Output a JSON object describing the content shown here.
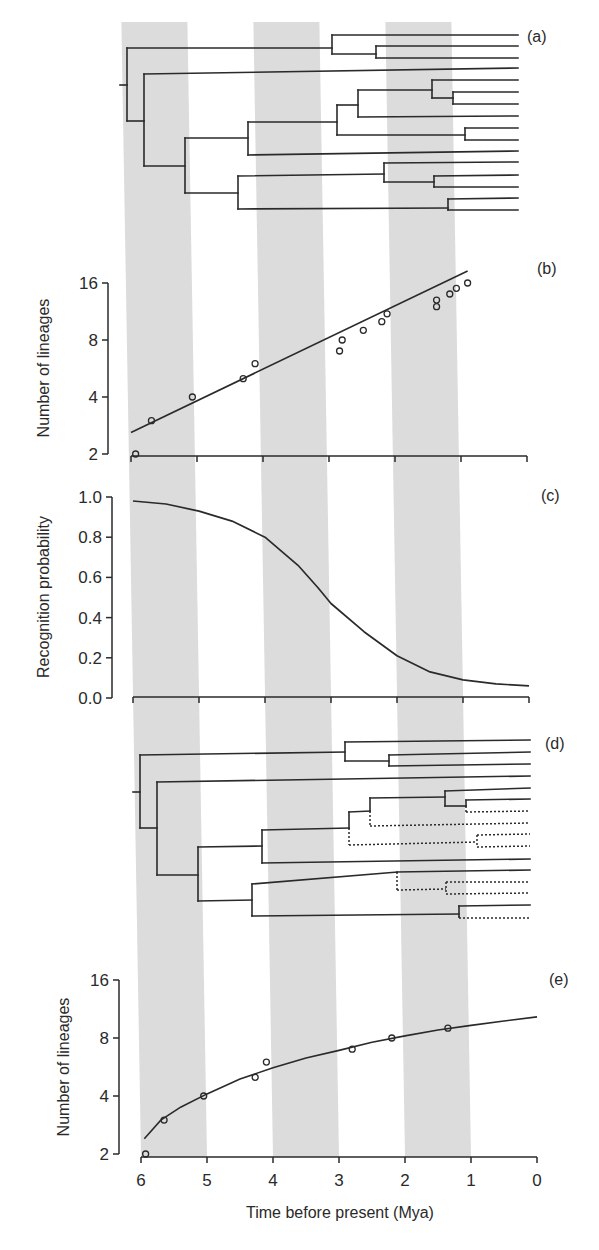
{
  "chart_data": [
    {
      "panel": "(a)",
      "type": "tree",
      "description": "Reconstructed phylogeny of 16 extant lineages",
      "tips": 16
    },
    {
      "panel": "(b)",
      "type": "scatter",
      "xlabel": "Time before present (Mya)",
      "ylabel": "Number of lineages",
      "yscale": "log2",
      "yticks": [
        2,
        4,
        8,
        16
      ],
      "ylim": [
        2,
        16
      ],
      "xlim": [
        6,
        0
      ],
      "x": [
        5.93,
        5.69,
        5.07,
        4.3,
        4.12,
        2.84,
        2.8,
        2.48,
        2.2,
        2.12,
        1.37,
        1.37,
        1.17,
        1.07,
        0.9
      ],
      "y": [
        2,
        3,
        4,
        5,
        6,
        7,
        8,
        9,
        10,
        11,
        12,
        13,
        14,
        15,
        16
      ],
      "fit_line": {
        "x": [
          6.0,
          0.9
        ],
        "y": [
          2.6,
          18.5
        ]
      }
    },
    {
      "panel": "(c)",
      "type": "line",
      "xlabel": "Time before present (Mya)",
      "ylabel": "Recognition probability",
      "yticks": [
        0.0,
        0.2,
        0.4,
        0.6,
        0.8,
        1.0
      ],
      "ylim": [
        0,
        1
      ],
      "xlim": [
        6,
        0
      ],
      "x": [
        6.0,
        5.5,
        5.0,
        4.5,
        4.0,
        3.5,
        3.2,
        3.0,
        2.5,
        2.0,
        1.5,
        1.0,
        0.5,
        0.0
      ],
      "y": [
        0.98,
        0.965,
        0.93,
        0.88,
        0.8,
        0.66,
        0.55,
        0.47,
        0.33,
        0.21,
        0.13,
        0.09,
        0.07,
        0.06
      ]
    },
    {
      "panel": "(d)",
      "type": "tree",
      "description": "Phylogeny with unrecognized lineages dashed",
      "tips": 16
    },
    {
      "panel": "(e)",
      "type": "scatter",
      "xlabel": "Time before present (Mya)",
      "ylabel": "Number of lineages",
      "yscale": "log2",
      "yticks": [
        2,
        4,
        8,
        16
      ],
      "ylim": [
        2,
        16
      ],
      "xlim": [
        6,
        0
      ],
      "xticks": [
        6,
        5,
        4,
        3,
        2,
        1,
        0
      ],
      "x": [
        5.93,
        5.65,
        5.05,
        4.27,
        4.1,
        2.8,
        2.2,
        1.35
      ],
      "y": [
        2,
        3,
        4,
        5,
        6,
        7,
        8,
        9
      ],
      "fit_curve": {
        "x": [
          5.95,
          5.7,
          5.4,
          5.0,
          4.5,
          4.0,
          3.5,
          3.0,
          2.5,
          2.0,
          1.5,
          1.0,
          0.5,
          0.0
        ],
        "y": [
          2.4,
          3.0,
          3.5,
          4.1,
          4.9,
          5.6,
          6.3,
          6.9,
          7.6,
          8.2,
          8.8,
          9.3,
          9.8,
          10.3
        ]
      }
    }
  ],
  "figure": {
    "panel_labels": [
      "(a)",
      "(b)",
      "(c)",
      "(d)",
      "(e)"
    ],
    "xlabel": "Time before present (Mya)",
    "xtick_labels": [
      "6",
      "5",
      "4",
      "3",
      "2",
      "1",
      "0"
    ],
    "ylabel_lineages": "Number of lineages",
    "ylabel_recognition": "Recognition probability",
    "ytick_lineages": [
      "16",
      "8",
      "4",
      "2"
    ],
    "ytick_recognition": [
      "1.0",
      "0.8",
      "0.6",
      "0.4",
      "0.2",
      "0.0"
    ],
    "shaded_bands_mya": [
      [
        6,
        5
      ],
      [
        4,
        3
      ],
      [
        2,
        1
      ]
    ],
    "colors": {
      "band": "#dcdcdc",
      "line": "#2a2a2a",
      "text": "#2a2a2a"
    }
  },
  "trees": {
    "a": {
      "solid": [
        [
          120,
          85,
          127,
          85
        ],
        [
          127,
          48,
          127,
          121
        ],
        [
          127,
          48,
          332,
          48
        ],
        [
          332,
          35,
          332,
          54
        ],
        [
          332,
          35,
          518,
          35
        ],
        [
          332,
          54,
          376,
          54
        ],
        [
          376,
          46,
          376,
          58
        ],
        [
          376,
          46,
          518,
          46
        ],
        [
          376,
          58,
          518,
          58
        ],
        [
          127,
          121,
          144,
          121
        ],
        [
          144,
          74,
          144,
          166
        ],
        [
          144,
          74,
          518,
          68
        ],
        [
          144,
          166,
          185,
          166
        ],
        [
          185,
          138,
          185,
          193
        ],
        [
          185,
          138,
          248,
          138
        ],
        [
          248,
          122,
          248,
          155
        ],
        [
          248,
          122,
          337,
          122
        ],
        [
          337,
          105,
          337,
          135
        ],
        [
          337,
          105,
          358,
          105
        ],
        [
          358,
          90,
          358,
          117
        ],
        [
          358,
          90,
          432,
          90
        ],
        [
          432,
          80,
          432,
          98
        ],
        [
          432,
          80,
          518,
          80
        ],
        [
          432,
          98,
          453,
          98
        ],
        [
          453,
          92,
          453,
          104
        ],
        [
          453,
          92,
          518,
          92
        ],
        [
          453,
          104,
          518,
          104
        ],
        [
          358,
          117,
          518,
          116
        ],
        [
          337,
          135,
          465,
          135
        ],
        [
          465,
          128,
          465,
          140
        ],
        [
          465,
          128,
          518,
          128
        ],
        [
          465,
          140,
          518,
          140
        ],
        [
          248,
          155,
          518,
          151
        ],
        [
          185,
          193,
          238,
          193
        ],
        [
          238,
          176,
          238,
          209
        ],
        [
          238,
          176,
          384,
          174
        ],
        [
          384,
          163,
          384,
          182
        ],
        [
          384,
          163,
          518,
          162
        ],
        [
          384,
          182,
          434,
          182
        ],
        [
          434,
          176,
          434,
          187
        ],
        [
          434,
          176,
          518,
          175
        ],
        [
          434,
          187,
          518,
          187
        ],
        [
          238,
          209,
          448,
          208
        ],
        [
          448,
          199,
          448,
          210
        ],
        [
          448,
          199,
          518,
          198
        ],
        [
          448,
          210,
          518,
          210
        ]
      ],
      "dashed": []
    },
    "d": {
      "solid": [
        [
          133,
          792,
          140,
          792
        ],
        [
          140,
          755,
          140,
          828
        ],
        [
          140,
          755,
          345,
          752
        ],
        [
          345,
          742,
          345,
          761
        ],
        [
          345,
          742,
          530,
          740
        ],
        [
          345,
          761,
          389,
          761
        ],
        [
          389,
          755,
          389,
          766
        ],
        [
          389,
          755,
          530,
          752
        ],
        [
          389,
          766,
          530,
          764
        ],
        [
          140,
          828,
          157,
          828
        ],
        [
          157,
          782,
          157,
          875
        ],
        [
          157,
          782,
          530,
          776
        ],
        [
          157,
          875,
          198,
          875
        ],
        [
          198,
          847,
          198,
          901
        ],
        [
          198,
          847,
          262,
          846
        ],
        [
          262,
          830,
          262,
          863
        ],
        [
          262,
          830,
          349,
          828
        ],
        [
          349,
          812,
          349,
          828
        ],
        [
          349,
          812,
          370,
          811
        ],
        [
          370,
          798,
          370,
          811
        ],
        [
          370,
          798,
          445,
          797
        ],
        [
          445,
          791,
          445,
          806
        ],
        [
          445,
          791,
          530,
          788
        ],
        [
          445,
          806,
          466,
          806
        ],
        [
          466,
          800,
          466,
          806
        ],
        [
          466,
          800,
          530,
          799
        ],
        [
          262,
          863,
          530,
          859
        ],
        [
          198,
          901,
          252,
          900
        ],
        [
          252,
          884,
          252,
          916
        ],
        [
          252,
          884,
          397,
          872
        ],
        [
          397,
          872,
          530,
          870
        ],
        [
          252,
          916,
          459,
          914
        ],
        [
          459,
          906,
          459,
          916
        ],
        [
          459,
          906,
          530,
          905
        ]
      ],
      "dashed": [
        [
          466,
          806,
          466,
          812
        ],
        [
          466,
          812,
          530,
          811
        ],
        [
          370,
          811,
          370,
          826
        ],
        [
          370,
          826,
          530,
          823
        ],
        [
          349,
          828,
          349,
          845
        ],
        [
          349,
          845,
          477,
          842
        ],
        [
          477,
          835,
          477,
          847
        ],
        [
          477,
          835,
          530,
          834
        ],
        [
          477,
          847,
          530,
          846
        ],
        [
          397,
          872,
          397,
          890
        ],
        [
          397,
          890,
          446,
          889
        ],
        [
          446,
          882,
          446,
          894
        ],
        [
          446,
          882,
          530,
          882
        ],
        [
          446,
          894,
          530,
          893
        ],
        [
          459,
          916,
          459,
          918
        ],
        [
          459,
          918,
          530,
          918
        ]
      ]
    }
  }
}
